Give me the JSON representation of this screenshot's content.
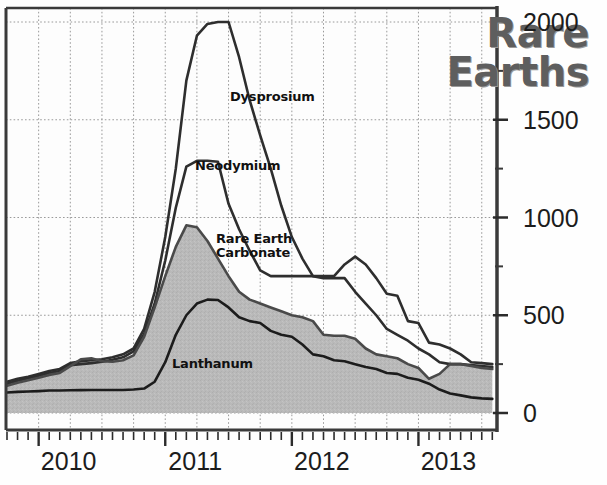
{
  "chart_data": {
    "type": "area",
    "title": "Rare\nEarths",
    "xlabel": "",
    "ylabel": "",
    "ylim": [
      0,
      2000
    ],
    "ytick_values": [
      0,
      500,
      1000,
      1500,
      2000
    ],
    "ytick_labels": [
      "0",
      "500",
      "1000",
      "1500",
      "2000"
    ],
    "xlim": [
      "2009-10",
      "2013-09"
    ],
    "xtick_labels": [
      "2010",
      "2011",
      "2012",
      "2013"
    ],
    "xtick_positions": [
      "2010-01",
      "2011-01",
      "2012-01",
      "2013-01"
    ],
    "grid": true,
    "grid_style": "dotted",
    "legend": "inline-annotations",
    "x": [
      "2009-10",
      "2009-11",
      "2009-12",
      "2010-01",
      "2010-02",
      "2010-03",
      "2010-04",
      "2010-05",
      "2010-06",
      "2010-07",
      "2010-08",
      "2010-09",
      "2010-10",
      "2010-11",
      "2010-12",
      "2011-01",
      "2011-02",
      "2011-03",
      "2011-04",
      "2011-05",
      "2011-06",
      "2011-07",
      "2011-08",
      "2011-09",
      "2011-10",
      "2011-11",
      "2011-12",
      "2012-01",
      "2012-02",
      "2012-03",
      "2012-04",
      "2012-05",
      "2012-06",
      "2012-07",
      "2012-08",
      "2012-09",
      "2012-10",
      "2012-11",
      "2012-12",
      "2013-01",
      "2013-02",
      "2013-03",
      "2013-04",
      "2013-05",
      "2013-06",
      "2013-07",
      "2013-08"
    ],
    "series": [
      {
        "name": "Dysprosium",
        "color": "#2e2e2e",
        "fill": "none",
        "peak_value": 2000,
        "peak_date": "2011-07",
        "values": [
          160,
          175,
          185,
          200,
          215,
          225,
          255,
          265,
          270,
          275,
          285,
          300,
          330,
          430,
          620,
          900,
          1250,
          1700,
          1930,
          1990,
          2000,
          2000,
          1820,
          1600,
          1420,
          1250,
          1060,
          900,
          790,
          700,
          690,
          690,
          690,
          620,
          560,
          500,
          430,
          400,
          370,
          330,
          300,
          260,
          250,
          250,
          245,
          240,
          235
        ]
      },
      {
        "name": "Neodymium",
        "color": "#2e2e2e",
        "fill": "none",
        "peak_value": 1290,
        "peak_date": "2011-07",
        "values": [
          150,
          165,
          178,
          190,
          205,
          215,
          245,
          250,
          255,
          262,
          272,
          285,
          315,
          405,
          560,
          780,
          1050,
          1260,
          1290,
          1290,
          1285,
          1070,
          940,
          830,
          730,
          700,
          700,
          700,
          700,
          700,
          700,
          700,
          760,
          800,
          760,
          690,
          610,
          600,
          470,
          460,
          360,
          350,
          330,
          300,
          260,
          255,
          250
        ]
      },
      {
        "name": "Rare Earth Carbonate",
        "color": "#4a4a4a",
        "fill": "#b9b9b9",
        "peak_value": 960,
        "peak_date": "2011-06",
        "values": [
          140,
          155,
          168,
          180,
          195,
          205,
          240,
          275,
          280,
          265,
          262,
          270,
          295,
          390,
          540,
          700,
          850,
          960,
          950,
          880,
          790,
          700,
          620,
          580,
          560,
          540,
          520,
          500,
          490,
          470,
          400,
          395,
          395,
          380,
          330,
          300,
          290,
          280,
          250,
          230,
          175,
          200,
          250,
          250,
          240,
          230,
          225
        ]
      },
      {
        "name": "Lanthanum",
        "color": "#1c1c1c",
        "fill": "none",
        "peak_value": 580,
        "peak_date": "2011-07",
        "values": [
          105,
          108,
          110,
          112,
          115,
          115,
          116,
          117,
          118,
          118,
          118,
          118,
          120,
          125,
          160,
          260,
          400,
          500,
          560,
          580,
          578,
          540,
          490,
          470,
          460,
          420,
          400,
          390,
          350,
          300,
          290,
          270,
          265,
          250,
          235,
          225,
          205,
          200,
          180,
          170,
          150,
          120,
          100,
          90,
          80,
          75,
          72
        ]
      }
    ],
    "annotations": [
      {
        "text": "Dysprosium",
        "x_px": 230,
        "y_px": 90
      },
      {
        "text": "Neodymium",
        "x_px": 195,
        "y_px": 159
      },
      {
        "text": "Rare Earth\nCarbonate",
        "x_px": 216,
        "y_px": 232
      },
      {
        "text": "Lanthanum",
        "x_px": 172,
        "y_px": 357
      }
    ]
  }
}
